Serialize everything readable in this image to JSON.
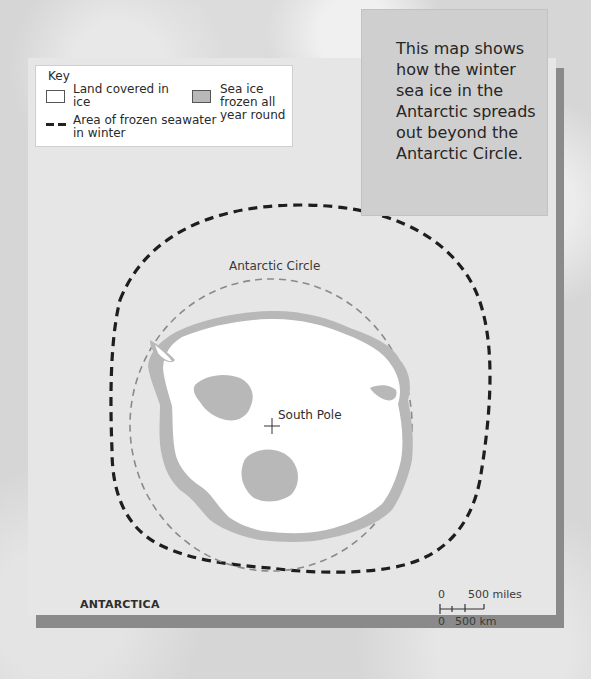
{
  "key": {
    "title": "Key",
    "items": [
      {
        "label": "Land covered in ice",
        "swatch": "white-box",
        "color": "#ffffff"
      },
      {
        "label": "Sea ice frozen all year round",
        "swatch": "gray-box",
        "color": "#b8b8b8"
      },
      {
        "label": "Area of frozen seawater in winter",
        "swatch": "black-dashed-line",
        "color": "#1e1e1e"
      }
    ]
  },
  "note": {
    "text": "This map shows how the winter sea ice in the Antarctic spreads out beyond the Antarctic Circle."
  },
  "map": {
    "region_label": "ANTARCTICA",
    "circle_label": "Antarctic Circle",
    "pole_label": "South Pole",
    "colors": {
      "panel": "#e6e6e6",
      "land": "#ffffff",
      "sea_ice": "#b8b8b8",
      "winter_ice_line": "#1e1e1e",
      "antarctic_circle_line": "#8a8a8a",
      "panel_shadow": "#8a8a8a"
    }
  },
  "scale_bar": {
    "top_zero": "0",
    "top_label": "500 miles",
    "bottom_zero": "0",
    "bottom_label": "500 km"
  }
}
